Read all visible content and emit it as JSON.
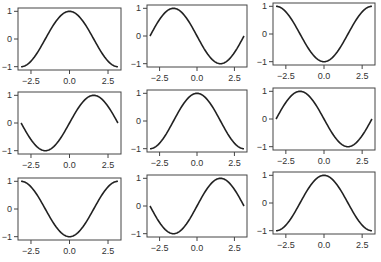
{
  "chart_data": [
    {
      "type": "line",
      "title": "",
      "function": "cos(x)",
      "x_range": [
        -3.1416,
        3.1416
      ],
      "ylim": [
        -1,
        1
      ],
      "xticks": [
        "-2.5",
        "0.0",
        "2.5"
      ],
      "yticks": [
        "-1",
        "0",
        "1"
      ],
      "xlabel": "",
      "ylabel": "",
      "grid": false,
      "x": [
        -3.14,
        -2.5,
        -1.5,
        0,
        1.5,
        2.5,
        3.14
      ],
      "y": [
        -1,
        -0.8,
        0.07,
        1,
        0.07,
        -0.8,
        -1
      ]
    },
    {
      "type": "line",
      "title": "",
      "function": "-sin(x)",
      "x_range": [
        -3.1416,
        3.1416
      ],
      "ylim": [
        -1,
        1
      ],
      "xticks": [
        "-2.5",
        "0.0",
        "2.5"
      ],
      "yticks": [
        "-1",
        "0",
        "1"
      ],
      "xlabel": "",
      "ylabel": "",
      "grid": false,
      "x": [
        -3.14,
        -1.57,
        0,
        1.57,
        3.14
      ],
      "y": [
        0,
        1,
        0,
        -1,
        0
      ]
    },
    {
      "type": "line",
      "title": "",
      "function": "-cos(x)",
      "x_range": [
        -3.1416,
        3.1416
      ],
      "ylim": [
        -1,
        1
      ],
      "xticks": [
        "-2.5",
        "0.0",
        "2.5"
      ],
      "yticks": [
        "-1",
        "0",
        "1"
      ],
      "xlabel": "",
      "ylabel": "",
      "grid": false,
      "x": [
        -3.14,
        -1.57,
        0,
        1.57,
        3.14
      ],
      "y": [
        1,
        0,
        -1,
        0,
        1
      ]
    },
    {
      "type": "line",
      "title": "",
      "function": "sin(x)",
      "x_range": [
        -3.1416,
        3.1416
      ],
      "ylim": [
        -1,
        1
      ],
      "xticks": [
        "-2.5",
        "0.0",
        "2.5"
      ],
      "yticks": [
        "-1",
        "0",
        "1"
      ],
      "xlabel": "",
      "ylabel": "",
      "grid": false,
      "x": [
        -3.14,
        -1.57,
        0,
        1.57,
        3.14
      ],
      "y": [
        0,
        -1,
        0,
        1,
        0
      ]
    },
    {
      "type": "line",
      "title": "",
      "function": "cos(x)",
      "x_range": [
        -3.1416,
        3.1416
      ],
      "ylim": [
        -1,
        1
      ],
      "xticks": [
        "-2.5",
        "0.0",
        "2.5"
      ],
      "yticks": [
        "-1",
        "0",
        "1"
      ],
      "xlabel": "",
      "ylabel": "",
      "grid": false,
      "x": [
        -3.14,
        -1.57,
        0,
        1.57,
        3.14
      ],
      "y": [
        -1,
        0,
        1,
        0,
        -1
      ]
    },
    {
      "type": "line",
      "title": "",
      "function": "-sin(x)",
      "x_range": [
        -3.1416,
        3.1416
      ],
      "ylim": [
        -1,
        1
      ],
      "xticks": [
        "-2.5",
        "0.0",
        "2.5"
      ],
      "yticks": [
        "-1",
        "0",
        "1"
      ],
      "xlabel": "",
      "ylabel": "",
      "grid": false,
      "x": [
        -3.14,
        -1.57,
        0,
        1.57,
        3.14
      ],
      "y": [
        0,
        1,
        0,
        -1,
        0
      ]
    },
    {
      "type": "line",
      "title": "",
      "function": "-cos(x)",
      "x_range": [
        -3.1416,
        3.1416
      ],
      "ylim": [
        -1,
        1
      ],
      "xticks": [
        "-2.5",
        "0.0",
        "2.5"
      ],
      "yticks": [
        "-1",
        "0",
        "1"
      ],
      "xlabel": "",
      "ylabel": "",
      "grid": false,
      "x": [
        -3.14,
        -1.57,
        0,
        1.57,
        3.14
      ],
      "y": [
        1,
        0,
        -1,
        0,
        1
      ]
    },
    {
      "type": "line",
      "title": "",
      "function": "sin(x)",
      "x_range": [
        -3.1416,
        3.1416
      ],
      "ylim": [
        -1,
        1
      ],
      "xticks": [
        "-2.5",
        "0.0",
        "2.5"
      ],
      "yticks": [
        "-1",
        "0",
        "1"
      ],
      "xlabel": "",
      "ylabel": "",
      "grid": false,
      "x": [
        -3.14,
        -1.57,
        0,
        1.57,
        3.14
      ],
      "y": [
        0,
        -1,
        0,
        1,
        0
      ]
    },
    {
      "type": "line",
      "title": "",
      "function": "cos(x)",
      "x_range": [
        -3.1416,
        3.1416
      ],
      "ylim": [
        -1,
        1
      ],
      "xticks": [
        "-2.5",
        "0.0",
        "2.5"
      ],
      "yticks": [
        "-1",
        "0",
        "1"
      ],
      "xlabel": "",
      "ylabel": "",
      "grid": false,
      "x": [
        -3.14,
        -1.57,
        0,
        1.57,
        3.14
      ],
      "y": [
        -1,
        0,
        1,
        0,
        -1
      ]
    }
  ],
  "layout": {
    "rows": 3,
    "cols": 3
  },
  "panels": [
    {
      "left": 18,
      "top": 8,
      "w": 103,
      "h": 62,
      "fn": "cos"
    },
    {
      "left": 147,
      "top": 5,
      "w": 100,
      "h": 62,
      "fn": "-sin"
    },
    {
      "left": 273,
      "top": 3,
      "w": 102,
      "h": 62,
      "fn": "-cos"
    },
    {
      "left": 18,
      "top": 92,
      "w": 103,
      "h": 62,
      "fn": "sin"
    },
    {
      "left": 147,
      "top": 90,
      "w": 100,
      "h": 62,
      "fn": "cos"
    },
    {
      "left": 273,
      "top": 88,
      "w": 102,
      "h": 62,
      "fn": "-sin"
    },
    {
      "left": 18,
      "top": 178,
      "w": 103,
      "h": 62,
      "fn": "-cos"
    },
    {
      "left": 147,
      "top": 175,
      "w": 100,
      "h": 62,
      "fn": "sin"
    },
    {
      "left": 273,
      "top": 172,
      "w": 102,
      "h": 62,
      "fn": "cos"
    }
  ],
  "tick_labels": {
    "x": [
      "-2.5",
      "0.0",
      "2.5"
    ],
    "y": [
      "-1",
      "0",
      "1"
    ]
  }
}
